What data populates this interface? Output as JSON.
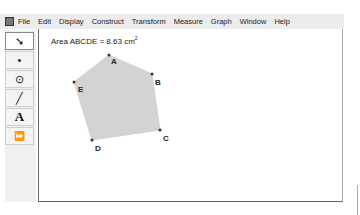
{
  "menubar": {
    "items": [
      "File",
      "Edit",
      "Display",
      "Construct",
      "Transform",
      "Measure",
      "Graph",
      "Window",
      "Help"
    ]
  },
  "toolbar": {
    "tools": [
      {
        "name": "selection-arrow",
        "glyph": "➘"
      },
      {
        "name": "point",
        "glyph": "•"
      },
      {
        "name": "compass",
        "glyph": "⊙"
      },
      {
        "name": "straightedge",
        "glyph": "╱"
      },
      {
        "name": "text",
        "glyph": "A"
      },
      {
        "name": "custom",
        "glyph": "⏩"
      }
    ]
  },
  "canvas": {
    "measurement": {
      "label": "Area ABCDE = 8.63 cm",
      "exponent": "2"
    },
    "polygon": {
      "fill": "#d3d3d3",
      "points": [
        {
          "label": "A",
          "x": 70,
          "y": 26
        },
        {
          "label": "B",
          "x": 113,
          "y": 45
        },
        {
          "label": "C",
          "x": 121,
          "y": 101
        },
        {
          "label": "D",
          "x": 53,
          "y": 111
        },
        {
          "label": "E",
          "x": 35,
          "y": 53
        }
      ]
    }
  }
}
